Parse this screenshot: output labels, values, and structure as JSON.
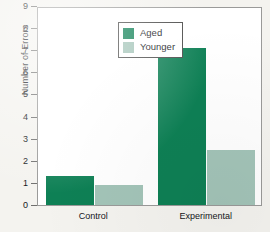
{
  "chart_data": {
    "type": "bar",
    "title": "",
    "xlabel": "",
    "ylabel": "Number of Errors",
    "categories": [
      "Control",
      "Experimental"
    ],
    "series": [
      {
        "name": "Aged",
        "color": "#0e8055",
        "values": [
          1.3,
          7.1
        ]
      },
      {
        "name": "Younger",
        "color": "#a3c4b8",
        "values": [
          0.9,
          2.5
        ]
      }
    ],
    "ylim": [
      0,
      9
    ],
    "yticks": [
      0,
      1,
      2,
      3,
      4,
      5,
      6,
      7,
      8,
      9
    ],
    "ytick_labels": [
      "0",
      "1",
      "2",
      "3",
      "4",
      "5",
      "6",
      "7",
      "8",
      "9"
    ],
    "grid": false,
    "legend_position": "upper-left-inside",
    "legend_entries": [
      "Aged",
      "Younger"
    ]
  },
  "axes": {
    "y_axis_title": "Number of Errors"
  },
  "legend": {
    "aged_label": "Aged",
    "younger_label": "Younger"
  },
  "colors": {
    "aged": "#0e8055",
    "younger": "#a3c4b8",
    "plot_background": "#ffffff",
    "page_background": "#f4f3ef",
    "frame": "#9a9a99",
    "text": "#15161a"
  }
}
